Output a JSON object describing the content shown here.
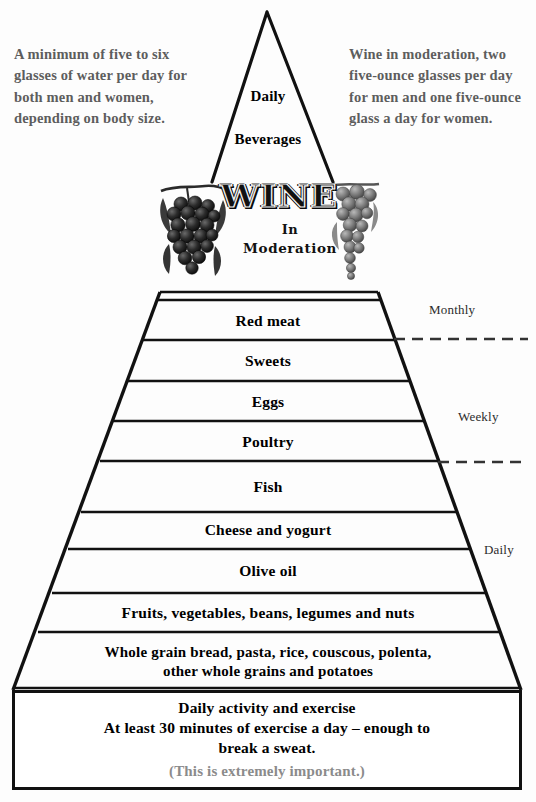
{
  "notes": {
    "left": "A minimum of five to six glasses of water per day for both men and women, depending on body size.",
    "right": "Wine in moderation, two five-ounce glasses per day for men and one five-ounce glass a day for women."
  },
  "apex": {
    "line1": "Daily",
    "line2": "Beverages"
  },
  "wine_banner": {
    "word": "WINE",
    "sub_line1": "In",
    "sub_line2": "Moderation",
    "left_graphic": "grape-cluster-icon",
    "right_graphic": "grape-vine-icon"
  },
  "frequency_labels": [
    {
      "id": "monthly",
      "text": "Monthly"
    },
    {
      "id": "weekly",
      "text": "Weekly"
    },
    {
      "id": "daily",
      "text": "Daily"
    }
  ],
  "rows": [
    {
      "id": "red-meat",
      "text": "Red meat"
    },
    {
      "id": "sweets",
      "text": "Sweets"
    },
    {
      "id": "eggs",
      "text": "Eggs"
    },
    {
      "id": "poultry",
      "text": "Poultry"
    },
    {
      "id": "fish",
      "text": "Fish"
    },
    {
      "id": "cheese",
      "text": "Cheese and yogurt"
    },
    {
      "id": "olive-oil",
      "text": "Olive oil"
    },
    {
      "id": "produce",
      "text": "Fruits, vegetables, beans, legumes and nuts"
    },
    {
      "id": "grains",
      "text": "Whole grain bread, pasta, rice, couscous, polenta,\nother whole grains and potatoes"
    }
  ],
  "base": {
    "lines": "Daily activity and exercise\nAt least 30 minutes of exercise a day – enough to\nbreak a sweat.",
    "note": "(This is extremely important.)"
  },
  "colors": {
    "ink": "#111111",
    "note_gray": "#5d5d5d",
    "base_note_gray": "#8b8b8b",
    "background": "#ffffff"
  }
}
